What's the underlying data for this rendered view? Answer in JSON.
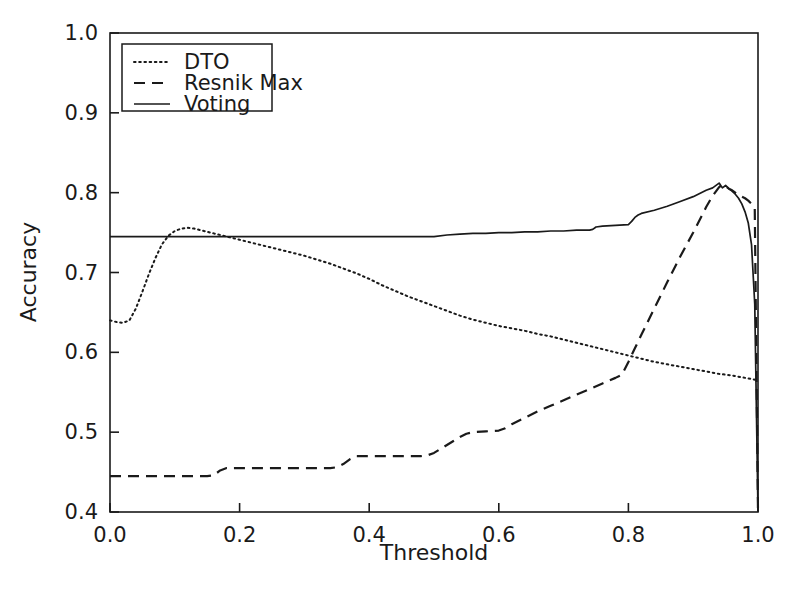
{
  "chart_data": {
    "type": "line",
    "title": "",
    "xlabel": "Threshold",
    "ylabel": "Accuracy",
    "xlim": [
      0.0,
      1.0
    ],
    "ylim": [
      0.4,
      1.0
    ],
    "xticks": [
      "0.0",
      "0.2",
      "0.4",
      "0.6",
      "0.8",
      "1.0"
    ],
    "xtick_values": [
      0.0,
      0.2,
      0.4,
      0.6,
      0.8,
      1.0
    ],
    "yticks": [
      "0.4",
      "0.5",
      "0.6",
      "0.7",
      "0.8",
      "0.9",
      "1.0"
    ],
    "ytick_values": [
      0.4,
      0.5,
      0.6,
      0.7,
      0.8,
      0.9,
      1.0
    ],
    "grid": false,
    "legend_position": "upper left",
    "line_color": "#1a1a1a",
    "series": [
      {
        "name": "DTO",
        "style": "dotted",
        "x": [
          0.0,
          0.01,
          0.02,
          0.03,
          0.04,
          0.05,
          0.06,
          0.07,
          0.08,
          0.09,
          0.1,
          0.11,
          0.12,
          0.13,
          0.14,
          0.15,
          0.16,
          0.17,
          0.18,
          0.19,
          0.2,
          0.22,
          0.24,
          0.26,
          0.28,
          0.3,
          0.32,
          0.34,
          0.36,
          0.38,
          0.4,
          0.42,
          0.44,
          0.46,
          0.48,
          0.5,
          0.52,
          0.54,
          0.56,
          0.58,
          0.6,
          0.62,
          0.64,
          0.66,
          0.68,
          0.7,
          0.72,
          0.74,
          0.76,
          0.78,
          0.8,
          0.82,
          0.84,
          0.86,
          0.88,
          0.9,
          0.92,
          0.94,
          0.96,
          0.98,
          1.0
        ],
        "y": [
          0.64,
          0.638,
          0.637,
          0.64,
          0.655,
          0.676,
          0.698,
          0.718,
          0.735,
          0.746,
          0.752,
          0.755,
          0.756,
          0.755,
          0.753,
          0.751,
          0.749,
          0.747,
          0.745,
          0.743,
          0.741,
          0.737,
          0.733,
          0.729,
          0.725,
          0.721,
          0.716,
          0.711,
          0.705,
          0.699,
          0.692,
          0.684,
          0.677,
          0.67,
          0.664,
          0.658,
          0.652,
          0.646,
          0.641,
          0.637,
          0.633,
          0.63,
          0.627,
          0.623,
          0.62,
          0.616,
          0.612,
          0.608,
          0.604,
          0.6,
          0.596,
          0.592,
          0.588,
          0.585,
          0.582,
          0.579,
          0.576,
          0.573,
          0.571,
          0.568,
          0.565
        ]
      },
      {
        "name": "Resnik Max",
        "style": "dashed",
        "x": [
          0.0,
          0.05,
          0.1,
          0.15,
          0.16,
          0.17,
          0.18,
          0.22,
          0.26,
          0.3,
          0.34,
          0.35,
          0.36,
          0.37,
          0.38,
          0.39,
          0.42,
          0.45,
          0.48,
          0.49,
          0.5,
          0.51,
          0.52,
          0.53,
          0.54,
          0.55,
          0.56,
          0.58,
          0.6,
          0.61,
          0.62,
          0.64,
          0.66,
          0.68,
          0.7,
          0.72,
          0.74,
          0.76,
          0.78,
          0.79,
          0.8,
          0.81,
          0.82,
          0.84,
          0.86,
          0.88,
          0.9,
          0.92,
          0.93,
          0.94,
          0.945,
          0.95,
          0.955,
          0.96,
          0.965,
          0.97,
          0.975,
          0.98,
          0.985,
          0.99,
          0.995,
          1.0
        ],
        "y": [
          0.445,
          0.445,
          0.445,
          0.445,
          0.446,
          0.452,
          0.455,
          0.455,
          0.455,
          0.455,
          0.455,
          0.456,
          0.46,
          0.466,
          0.47,
          0.47,
          0.47,
          0.47,
          0.47,
          0.471,
          0.474,
          0.479,
          0.484,
          0.489,
          0.494,
          0.498,
          0.5,
          0.501,
          0.502,
          0.505,
          0.51,
          0.518,
          0.526,
          0.533,
          0.54,
          0.547,
          0.554,
          0.561,
          0.568,
          0.572,
          0.588,
          0.605,
          0.622,
          0.655,
          0.688,
          0.72,
          0.75,
          0.782,
          0.796,
          0.807,
          0.81,
          0.808,
          0.805,
          0.803,
          0.8,
          0.798,
          0.795,
          0.793,
          0.79,
          0.786,
          0.78,
          0.4
        ]
      },
      {
        "name": "Voting",
        "style": "solid",
        "x": [
          0.0,
          0.05,
          0.1,
          0.15,
          0.2,
          0.25,
          0.3,
          0.35,
          0.4,
          0.45,
          0.5,
          0.52,
          0.54,
          0.56,
          0.58,
          0.6,
          0.62,
          0.64,
          0.66,
          0.68,
          0.7,
          0.72,
          0.74,
          0.745,
          0.75,
          0.76,
          0.78,
          0.8,
          0.805,
          0.81,
          0.815,
          0.82,
          0.84,
          0.86,
          0.88,
          0.9,
          0.92,
          0.93,
          0.94,
          0.945,
          0.95,
          0.955,
          0.96,
          0.965,
          0.97,
          0.975,
          0.98,
          0.985,
          0.99,
          0.995,
          1.0
        ],
        "y": [
          0.745,
          0.745,
          0.745,
          0.745,
          0.745,
          0.745,
          0.745,
          0.745,
          0.745,
          0.745,
          0.745,
          0.747,
          0.748,
          0.749,
          0.749,
          0.75,
          0.75,
          0.751,
          0.751,
          0.752,
          0.752,
          0.753,
          0.753,
          0.754,
          0.757,
          0.758,
          0.759,
          0.76,
          0.764,
          0.769,
          0.772,
          0.774,
          0.778,
          0.783,
          0.789,
          0.795,
          0.803,
          0.806,
          0.812,
          0.806,
          0.809,
          0.805,
          0.802,
          0.798,
          0.793,
          0.786,
          0.776,
          0.762,
          0.735,
          0.66,
          0.4
        ]
      }
    ],
    "legend_entries": [
      {
        "label": "DTO",
        "style": "dotted"
      },
      {
        "label": "Resnik Max",
        "style": "dashed"
      },
      {
        "label": "Voting",
        "style": "solid"
      }
    ]
  }
}
